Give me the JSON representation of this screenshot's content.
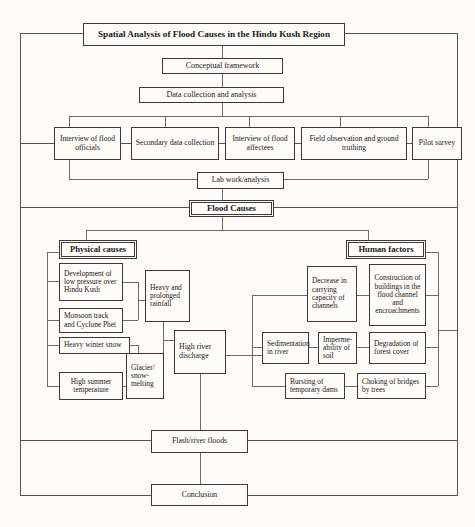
{
  "diagram": {
    "title": "Spatial Analysis of Flood Causes in the Hindu Kush Region",
    "type": "flowchart",
    "nodes": {
      "title": "Spatial Analysis of Flood Causes in the Hindu Kush Region",
      "conceptual_framework": "Conceptual framework",
      "data_collection": "Data collection and analysis",
      "interview_officials": "Interview of flood officials",
      "secondary_data": "Secondary data collection",
      "interview_affectees": "Interview of flood affectees",
      "field_observation": "Field observation and ground truthing",
      "pilot_survey": "Pilot survey",
      "lab_work": "Lab work/analysis",
      "flood_causes": "Flood Causes",
      "physical_causes": "Physical causes",
      "human_factors": "Human factors",
      "low_pressure": "Development of low pressure over Hindu Kush",
      "monsoon_track": "Monsoon track and Cyclone Phet",
      "winter_snow": "Heavy winter snow",
      "summer_temperature": "High summer temperature",
      "heavy_rainfall": "Heavy and prolonged rainfall",
      "glacier_melting": "Glacier/ snow- melting",
      "high_discharge": "High river discharge",
      "decrease_capacity": "Decrease in carrying capacity of channels",
      "construction_buildings": "Construction of buildings in the flood channel and encroachments",
      "sedimentation": "Sedimentation in river",
      "impermeability": "Imperme- ability of soil",
      "forest_degradation": "Degradation of forest cover",
      "bursting_dams": "Bursting of temporary dams",
      "choking_bridges": "Choking of bridges by trees",
      "flash_floods": "Flash/river floods",
      "conclusion": "Conclusion"
    },
    "colors": {
      "background": "#fdfcf7",
      "border": "#3a3a3a",
      "connector": "#6a6a6a",
      "text": "#1a1a1a"
    }
  }
}
